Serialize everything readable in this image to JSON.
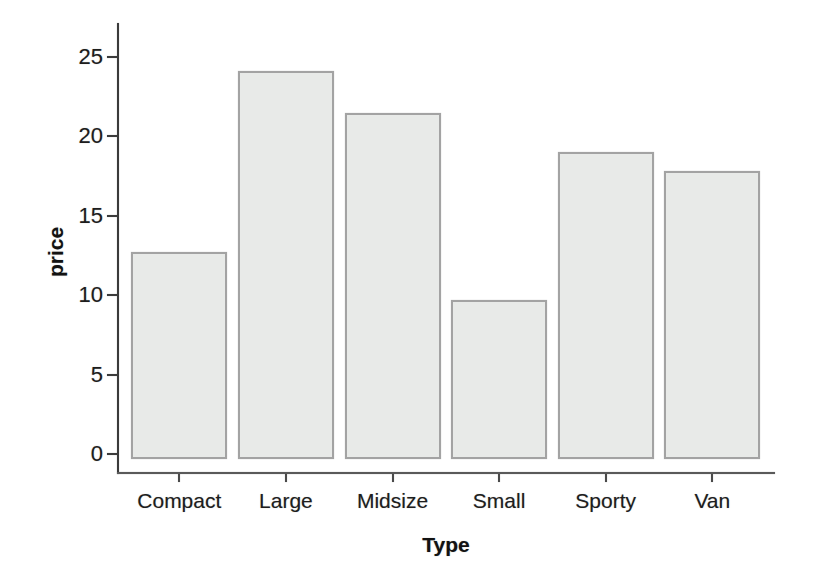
{
  "chart_data": {
    "type": "bar",
    "title": "",
    "xlabel": "Type",
    "ylabel": "price",
    "categories": [
      "Compact",
      "Large",
      "Midsize",
      "Small",
      "Sporty",
      "Van"
    ],
    "values": [
      12.7,
      24.1,
      21.5,
      9.7,
      19.0,
      17.8
    ],
    "yticks": [
      0,
      5,
      10,
      15,
      20,
      25
    ],
    "ylim": [
      0,
      26.5
    ],
    "grid": false,
    "legend": "none",
    "bar_fill": "#e8eae8",
    "bar_border": "#a3a3a3",
    "axis_color": "#3b3b3b",
    "text_color": "#1d1d1d",
    "background": "#ffffff"
  }
}
